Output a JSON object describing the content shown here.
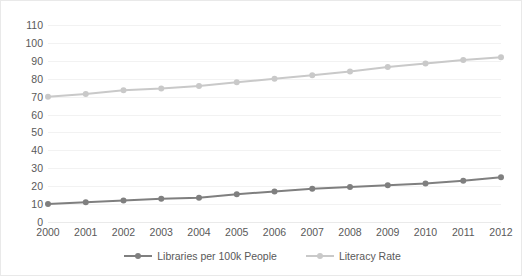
{
  "chart_data": {
    "type": "line",
    "title": "",
    "subtitle": "",
    "xlabel": "",
    "ylabel": "",
    "categories": [
      "2000",
      "2001",
      "2002",
      "2003",
      "2004",
      "2005",
      "2006",
      "2007",
      "2008",
      "2009",
      "2010",
      "2011",
      "2012"
    ],
    "x": [
      2000,
      2001,
      2002,
      2003,
      2004,
      2005,
      2006,
      2007,
      2008,
      2009,
      2010,
      2011,
      2012
    ],
    "ylim": [
      0,
      110
    ],
    "ytick_step": 10,
    "yticks": [
      0,
      10,
      20,
      30,
      40,
      50,
      60,
      70,
      80,
      90,
      100,
      110
    ],
    "ytick_labels": [
      "0",
      "10",
      "20",
      "30",
      "40",
      "50",
      "60",
      "70",
      "80",
      "90",
      "100",
      "110"
    ],
    "grid": true,
    "grid_axis": "y",
    "legend_position": "bottom",
    "series": [
      {
        "name": "Libraries per 100k People",
        "color": "#7F7F7F",
        "marker": "circle",
        "values": [
          10,
          11,
          12,
          13,
          13.5,
          15.5,
          17,
          18.5,
          19.5,
          20.5,
          21.5,
          23,
          25
        ]
      },
      {
        "name": "Literacy Rate",
        "color": "#C9C9C9",
        "marker": "circle",
        "values": [
          70,
          71.5,
          73.5,
          74.5,
          76,
          78,
          80,
          82,
          84,
          86.5,
          88.5,
          90.5,
          92
        ]
      }
    ]
  },
  "colors": {
    "gridline": "#F2F2F2",
    "axis_text": "#595959",
    "border": "#E9E9E9",
    "background": "#FFFFFF",
    "series_1": "#7F7F7F",
    "series_2": "#C9C9C9"
  }
}
